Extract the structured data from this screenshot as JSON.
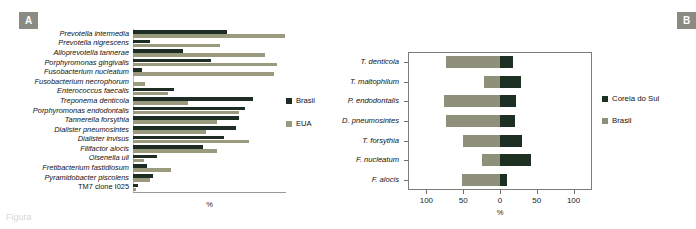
{
  "figure": {
    "panels": [
      {
        "id": "A",
        "badge_label": "A"
      },
      {
        "id": "B",
        "badge_label": "B"
      }
    ],
    "caption_fragment": "Figura"
  },
  "chart_data": [
    {
      "type": "bar",
      "panel": "A",
      "orientation": "horizontal",
      "title": "",
      "xlabel": "%",
      "ylabel": "",
      "grid": false,
      "legend_position": "right",
      "xlim": [
        0,
        100
      ],
      "xticks_visible": false,
      "categories": [
        "Prevotella intermedia",
        "Prevotella  nigrescens",
        "Alloprevotella tannerae",
        "Porphyromonas gingivalis",
        "Fusobacterium nucleatum",
        "Fusobacterium necrophorum",
        "Enterococcus faecalis",
        "Treponema denticola",
        "Porphyromonas endodontalis",
        "Tannerella forsythia",
        "Dialister pneumosintes",
        "Dialister invisus",
        "Filifactor alocis",
        "Olsenella uli",
        "Fretibacterium fastidiosum",
        "Pyramidobacter piscolens",
        "TM7 clone I025"
      ],
      "series": [
        {
          "name": "Brasil",
          "color": "#1d2d24",
          "values": [
            62,
            11,
            33,
            51,
            6,
            0,
            27,
            79,
            74,
            70,
            68,
            60,
            46,
            16,
            9,
            13,
            3
          ]
        },
        {
          "name": "EUA",
          "color": "#9a9a7e",
          "values": [
            100,
            57,
            87,
            95,
            93,
            8,
            23,
            36,
            70,
            55,
            48,
            76,
            55,
            7,
            25,
            11,
            2
          ]
        }
      ]
    },
    {
      "type": "bar",
      "panel": "B",
      "orientation": "horizontal",
      "subtype": "diverging",
      "title": "",
      "xlabel": "%",
      "ylabel": "",
      "grid": false,
      "legend_position": "right",
      "xlim": [
        -125,
        125
      ],
      "xticks": [
        -100,
        -50,
        0,
        50,
        100
      ],
      "xticklabels": [
        "100",
        "50",
        "0",
        "50",
        "100"
      ],
      "categories": [
        "T. denticola",
        "T. maltophilum",
        "P. endodontalis",
        "D. pneumosintes",
        "T. forsythia",
        "F. nucleatum",
        "F. alocis"
      ],
      "series": [
        {
          "name": "Brasil",
          "color": "#8e907a",
          "side": "left",
          "values": [
            73,
            22,
            76,
            74,
            50,
            25,
            52
          ]
        },
        {
          "name": "Coreia do Sul",
          "color": "#1e2f24",
          "side": "right",
          "values": [
            17,
            28,
            22,
            20,
            30,
            42,
            10
          ]
        }
      ]
    }
  ],
  "panel_a": {
    "axis_title": "%",
    "legend": [
      {
        "label": "Brasil",
        "color": "#1d2d24"
      },
      {
        "label": "EUA",
        "color": "#9a9a7e"
      }
    ]
  },
  "panel_b": {
    "axis_title": "%",
    "tick_labels": [
      "100",
      "50",
      "0",
      "50",
      "100"
    ],
    "legend": [
      {
        "label": "Coreia do Sul",
        "color": "#1e2f24"
      },
      {
        "label": "Brasil",
        "color": "#8e907a"
      }
    ]
  }
}
